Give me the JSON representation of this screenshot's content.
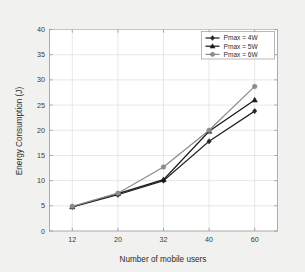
{
  "chart_data": {
    "type": "line",
    "title": "",
    "xlabel": "Number of mobile users",
    "ylabel": "Energy Consumption (J)",
    "categories": [
      "12",
      "20",
      "32",
      "40",
      "60"
    ],
    "x": [
      12,
      20,
      32,
      40,
      60
    ],
    "xlim": [
      0,
      4
    ],
    "ylim": [
      0,
      40
    ],
    "yticks": [
      "0",
      "5",
      "10",
      "15",
      "20",
      "25",
      "30",
      "35",
      "40"
    ],
    "ytick_values": [
      0,
      5,
      10,
      15,
      20,
      25,
      30,
      35,
      40
    ],
    "grid": true,
    "legend_position": "top-right",
    "series": [
      {
        "name": "Pmax = 4W",
        "values": [
          4.8,
          7.2,
          10.0,
          17.8,
          23.8
        ],
        "color": "#262626",
        "marker": "diamond"
      },
      {
        "name": "Pmax = 5W",
        "values": [
          4.8,
          7.4,
          10.2,
          19.8,
          26.0
        ],
        "color": "#1a1a1a",
        "marker": "triangle"
      },
      {
        "name": "Pmax = 6W",
        "values": [
          4.9,
          7.5,
          12.7,
          20.0,
          28.7
        ],
        "color": "#8c8c8c",
        "marker": "circle"
      }
    ]
  },
  "axes": {
    "y_title": "Energy Consumption (J)",
    "x_title": "Number of mobile users",
    "y_ticks": [
      "40",
      "35",
      "30",
      "25",
      "20",
      "15",
      "10",
      "5",
      "0"
    ],
    "x_ticks": [
      "12",
      "20",
      "32",
      "40",
      "60"
    ]
  },
  "legend": {
    "entries": [
      {
        "label": "Pmax = 4W"
      },
      {
        "label": "Pmax = 5W"
      },
      {
        "label": "Pmax = 6W"
      }
    ]
  },
  "colors": {
    "page_background": "#f1f1ef",
    "plot_background": "#ffffff",
    "grid": "#d8d8d8",
    "axis": "#9a9a9a",
    "series_4w": "#262626",
    "series_5w": "#1a1a1a",
    "series_6w": "#8c8c8c"
  }
}
